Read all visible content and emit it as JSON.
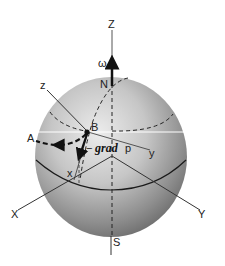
{
  "diagram": {
    "labels": {
      "Z_axis": "Z",
      "omega": "ω",
      "north": "N",
      "south": "S",
      "local_z": "z",
      "point_B": "B",
      "point_A": "A",
      "grad_minus": "−",
      "grad_word": "grad",
      "grad_p": "p",
      "local_y": "y",
      "local_x": "x",
      "X_axis": "X",
      "Y_axis": "Y"
    },
    "colors": {
      "sphere_light": "#e6e6e6",
      "sphere_mid": "#a8a8a8",
      "sphere_dark": "#6e6e6e",
      "lines": "#1a1a1a",
      "background": "#ffffff"
    }
  }
}
